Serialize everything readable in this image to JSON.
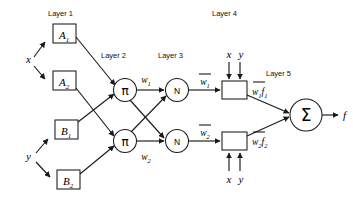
{
  "diagram": {
    "type": "neural-fuzzy-network",
    "colors": {
      "stroke": "#1a1a1a",
      "fill": "#ffffff",
      "background": "#ffffff"
    },
    "layer_labels": [
      {
        "id": "layer1",
        "text": "Layer 1"
      },
      {
        "id": "layer2",
        "text": "Layer 2"
      },
      {
        "id": "layer3",
        "text": "Layer 3"
      },
      {
        "id": "layer4",
        "text": "Layer 4"
      },
      {
        "id": "layer5",
        "text": "Layer 5"
      }
    ],
    "inputs": [
      {
        "id": "x",
        "label": "x"
      },
      {
        "id": "y",
        "label": "y"
      }
    ],
    "membership_nodes": [
      {
        "id": "A1",
        "base": "A",
        "sub": "1"
      },
      {
        "id": "A2",
        "base": "A",
        "sub": "2"
      },
      {
        "id": "B1",
        "base": "B",
        "sub": "1"
      },
      {
        "id": "B2",
        "base": "B",
        "sub": "2"
      }
    ],
    "product_nodes": [
      {
        "id": "pi1",
        "label": "π"
      },
      {
        "id": "pi2",
        "label": "π"
      }
    ],
    "norm_nodes": [
      {
        "id": "n1",
        "label": "N"
      },
      {
        "id": "n2",
        "label": "N"
      }
    ],
    "defuzz_nodes": [
      {
        "id": "box1",
        "top_inputs": [
          "x",
          "y"
        ]
      },
      {
        "id": "box2",
        "bottom_inputs": [
          "x",
          "y"
        ]
      }
    ],
    "sum_node": {
      "id": "sum",
      "label": "Σ"
    },
    "output": {
      "id": "f",
      "label": "f"
    },
    "edge_labels": [
      {
        "id": "w1",
        "base": "w",
        "sub": "1",
        "overbar": false
      },
      {
        "id": "w2",
        "base": "w",
        "sub": "2",
        "overbar": false
      },
      {
        "id": "wbar1",
        "base": "w",
        "sub": "1",
        "overbar": true
      },
      {
        "id": "wbar2",
        "base": "w",
        "sub": "2",
        "overbar": true
      },
      {
        "id": "wbar1f1",
        "base": "w",
        "sub": "1",
        "overbar": true,
        "suffix_base": "f",
        "suffix_sub": "1"
      },
      {
        "id": "wbar2f2",
        "base": "w",
        "sub": "2",
        "overbar": true,
        "suffix_base": "f",
        "suffix_sub": "2"
      }
    ],
    "box4_input_labels": [
      {
        "id": "box1-x",
        "label": "x"
      },
      {
        "id": "box1-y",
        "label": "y"
      },
      {
        "id": "box2-x",
        "label": "x"
      },
      {
        "id": "box2-y",
        "label": "y"
      }
    ]
  }
}
